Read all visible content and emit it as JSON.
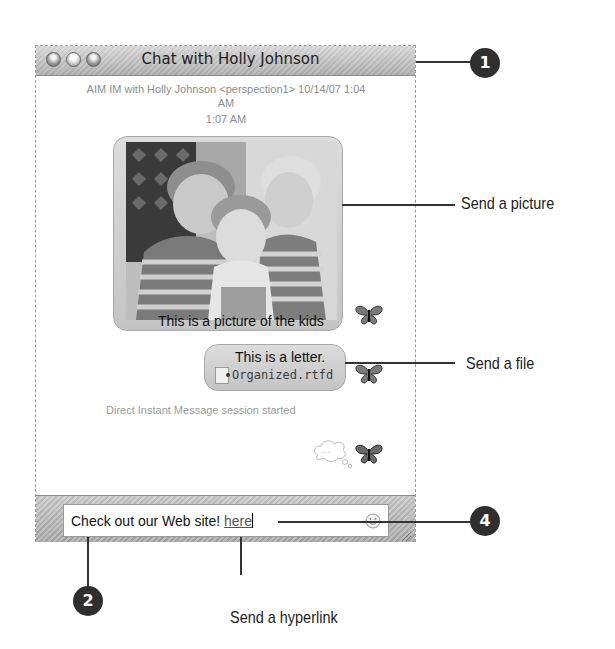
{
  "window": {
    "title": "Chat with Holly Johnson",
    "controls": [
      "close",
      "minimize",
      "zoom"
    ]
  },
  "transcript": {
    "header_line1": "AIM IM with Holly Johnson <perspection1>  10/14/07 1:04",
    "header_line2": "AM",
    "timestamp": "1:07 AM",
    "messages": [
      {
        "type": "picture",
        "caption": "This is a picture of the kids",
        "icon": "butterfly-buddy-icon"
      },
      {
        "type": "file",
        "text": "This is a letter.",
        "file_name": "Organized.rtfd",
        "file_icon": "document-icon",
        "icon": "butterfly-buddy-icon"
      }
    ],
    "status": "Direct Instant Message session started",
    "typing_indicator": "thought-bubble-icon"
  },
  "input": {
    "text": "Check out our Web site! ",
    "link_text": "here",
    "emoticon_icon": "smiley-icon"
  },
  "callouts": {
    "c1": "1",
    "c2": "2",
    "c4": "4",
    "send_picture": "Send a picture",
    "send_file": "Send a file",
    "send_hyperlink": "Send a hyperlink"
  },
  "colors": {
    "badge": "#2f2f2f",
    "titlebar": "#c4c4c4",
    "bubble": "#d0d0d0",
    "status_text": "#9a9a9a"
  }
}
